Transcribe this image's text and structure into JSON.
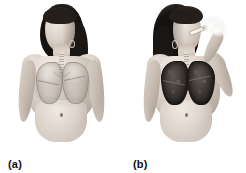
{
  "figure": {
    "background_color": "#ffffff",
    "width": 246,
    "height": 173,
    "style": "grayscale anatomical illustration",
    "panel_count": 2
  },
  "panels": [
    {
      "id": "a",
      "label": "(a)",
      "subject": "female figure, front view, head turned to her right, long dark hair",
      "condition": "non-smoker",
      "lungs": {
        "appearance": "healthy",
        "description": "pale translucent grey lungs showing through the chest",
        "color": "#cec6be",
        "outline_color": "#78706 8"
      },
      "airway": {
        "trachea_visible": true,
        "bronchi_visible": true,
        "color": "#ddd5cc"
      },
      "cigarette": false,
      "smoke": false,
      "arms": "both arms down at sides"
    },
    {
      "id": "b",
      "label": "(b)",
      "subject": "female figure, front view, head turned to her left, long dark hair",
      "condition": "smoker",
      "lungs": {
        "appearance": "diseased",
        "description": "dark, blackened, tar-stained lungs with mottled texture",
        "color": "#2c2724",
        "outline_color": "#15120f"
      },
      "airway": {
        "trachea_visible": true,
        "bronchi_visible": true,
        "color": "#ddd5cc"
      },
      "cigarette": true,
      "smoke": true,
      "arms": "right arm raised, hand holding a lit cigarette to the mouth"
    }
  ],
  "colors": {
    "background": "#ffffff",
    "skin_light": "#e2d9d1",
    "skin_mid": "#cdc2b8",
    "skin_shadow": "#9b8f86",
    "hair": "#15120f",
    "healthy_lung": "#cec6be",
    "diseased_lung": "#2c2724",
    "label_text": "#111111",
    "cigarette": "#fdfcfa"
  },
  "labels": {
    "panel_a": "(a)",
    "panel_b": "(b)"
  }
}
